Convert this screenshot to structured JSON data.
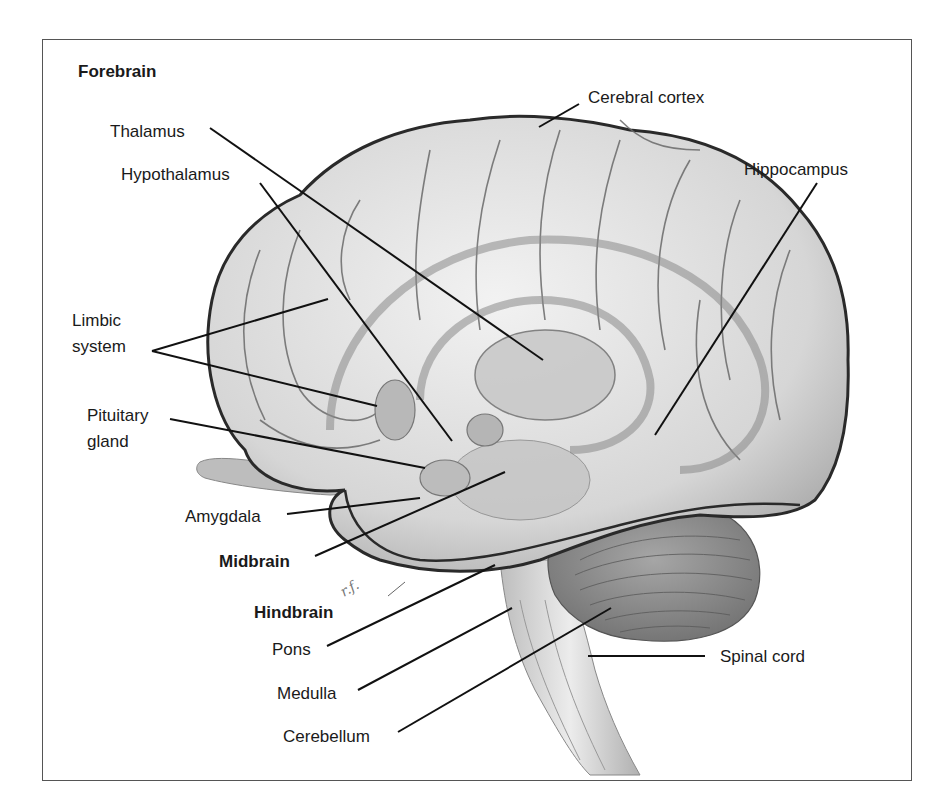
{
  "diagram": {
    "title": "Forebrain",
    "sections": {
      "forebrain": "Forebrain",
      "midbrain": "Midbrain",
      "hindbrain": "Hindbrain"
    },
    "labels": {
      "cerebral_cortex": "Cerebral cortex",
      "thalamus": "Thalamus",
      "hypothalamus": "Hypothalamus",
      "hippocampus": "Hippocampus",
      "limbic_system": "Limbic\nsystem",
      "pituitary_gland": "Pituitary\ngland",
      "amygdala": "Amygdala",
      "pons": "Pons",
      "medulla": "Medulla",
      "cerebellum": "Cerebellum",
      "spinal_cord": "Spinal cord"
    },
    "signature": "r.f.",
    "colors": {
      "line": "#111111",
      "brain_fill": "#d9d9d9",
      "brain_outline": "#2a2a2a",
      "cerebellum_fill": "#8c8c8c",
      "frame": "#555555"
    }
  }
}
